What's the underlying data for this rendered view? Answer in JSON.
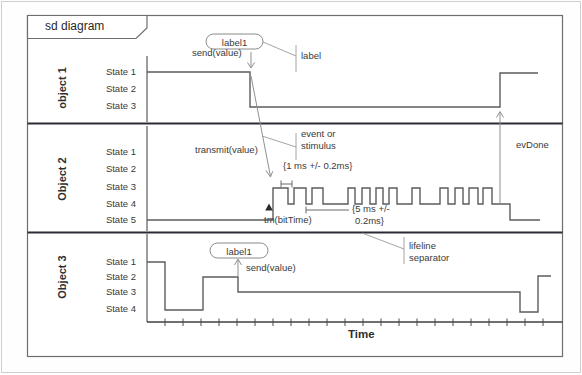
{
  "frame": {
    "title": "sd diagram"
  },
  "time_axis": {
    "label": "Time"
  },
  "objects": [
    {
      "name": "object 1",
      "states": [
        "State 1",
        "State 2",
        "State 3"
      ]
    },
    {
      "name": "Object 2",
      "states": [
        "State 1",
        "State 2",
        "State 3",
        "State 4",
        "State 5"
      ]
    },
    {
      "name": "Object 3",
      "states": [
        "State 1",
        "State 2",
        "State 3",
        "State 4"
      ]
    }
  ],
  "annotations": {
    "obj1_label1": "label1",
    "obj1_send": "send(value)",
    "obj1_label": "label",
    "obj2_transmit": "transmit(value)",
    "event_line1": "event or",
    "event_line2": "stimulus",
    "duration_1ms": "{1 ms +/- 0.2ms}",
    "tm_bittime": "tm(bitTime)",
    "duration_5ms_line1": "{5 ms +/-",
    "duration_5ms_line2": "0.2ms}",
    "evdone": "evDone",
    "obj3_label1": "label1",
    "obj3_send": "send(value)",
    "separator_line1": "lifeline",
    "separator_line2": "separator"
  },
  "colors": {
    "waveform": "#5c5c5c",
    "separator": "#2c2c34",
    "frame": "#6e6e6e",
    "annotation_line": "#909090",
    "text": "#3a3a3a"
  },
  "chart_data": {
    "type": "timing-diagram",
    "time_axis_label": "Time",
    "waveforms": [
      {
        "object": "object 1",
        "state_sequence": [
          "State 1",
          "State 3",
          "State 1"
        ],
        "events": [
          "send(value) causes fall State 1 -> State 3",
          "evDone causes rise State 3 -> State 1"
        ],
        "points": [
          [
            147,
            72
          ],
          [
            250,
            72
          ],
          [
            250,
            107
          ],
          [
            500,
            107
          ],
          [
            500,
            73
          ],
          [
            538,
            73
          ]
        ]
      },
      {
        "object": "Object 2",
        "state_sequence": [
          "State 5",
          "pulse train between State 3 and State 4",
          "State 5"
        ],
        "events": [
          "transmit(value) starts pulses",
          "tm(bitTime) at first rise",
          "{1 ms +/- 0.2ms} bit width",
          "{5 ms +/- 0.2ms} duration",
          "evDone at end"
        ],
        "points": [
          [
            147,
            220
          ],
          [
            273,
            220
          ],
          [
            273,
            188
          ],
          [
            288,
            188
          ],
          [
            288,
            204
          ],
          [
            294,
            204
          ],
          [
            294,
            188
          ],
          [
            306,
            188
          ],
          [
            306,
            204
          ],
          [
            312,
            204
          ],
          [
            312,
            188
          ],
          [
            323,
            188
          ],
          [
            323,
            204
          ],
          [
            348,
            204
          ],
          [
            348,
            188
          ],
          [
            355,
            188
          ],
          [
            355,
            204
          ],
          [
            362,
            204
          ],
          [
            362,
            188
          ],
          [
            370,
            188
          ],
          [
            370,
            204
          ],
          [
            376,
            204
          ],
          [
            376,
            188
          ],
          [
            383,
            188
          ],
          [
            383,
            204
          ],
          [
            389,
            204
          ],
          [
            389,
            188
          ],
          [
            397,
            188
          ],
          [
            397,
            204
          ],
          [
            412,
            204
          ],
          [
            412,
            188
          ],
          [
            420,
            188
          ],
          [
            420,
            204
          ],
          [
            440,
            204
          ],
          [
            440,
            188
          ],
          [
            448,
            188
          ],
          [
            448,
            204
          ],
          [
            455,
            204
          ],
          [
            455,
            188
          ],
          [
            463,
            188
          ],
          [
            463,
            204
          ],
          [
            469,
            204
          ],
          [
            469,
            188
          ],
          [
            478,
            188
          ],
          [
            478,
            204
          ],
          [
            483,
            204
          ],
          [
            483,
            188
          ],
          [
            492,
            188
          ],
          [
            492,
            204
          ],
          [
            510,
            204
          ],
          [
            510,
            220
          ],
          [
            540,
            220
          ]
        ]
      },
      {
        "object": "Object 3",
        "state_sequence": [
          "State 1",
          "State 4",
          "State 2",
          "State 3",
          "State 4",
          "State 2"
        ],
        "events": [
          "send(value) / label1 at State 2 -> State 3 fall"
        ],
        "points": [
          [
            147,
            262
          ],
          [
            165,
            262
          ],
          [
            165,
            310
          ],
          [
            203,
            310
          ],
          [
            203,
            277
          ],
          [
            238,
            277
          ],
          [
            238,
            292
          ],
          [
            520,
            292
          ],
          [
            520,
            312
          ],
          [
            538,
            312
          ],
          [
            538,
            276
          ],
          [
            551,
            276
          ]
        ]
      }
    ]
  }
}
